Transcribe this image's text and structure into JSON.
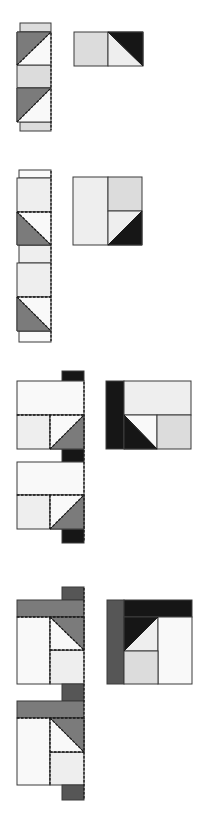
{
  "colors": {
    "light": "#dcdcdc",
    "lighter": "#eeeeee",
    "white": "#f9f9f9",
    "mid": "#7b7b7b",
    "dark": "#565656",
    "black": "#161616",
    "outline": "#3a3a3a"
  },
  "steps": [
    {
      "id": "step-1",
      "strip": {
        "rects": [
          {
            "x": 20,
            "y": 23,
            "w": 31,
            "h": 9,
            "fill": "light"
          },
          {
            "x": 17,
            "y": 65,
            "w": 34,
            "h": 23,
            "fill": "light"
          },
          {
            "x": 20,
            "y": 122,
            "w": 31,
            "h": 9,
            "fill": "light"
          }
        ],
        "triangles": [
          {
            "pts": "17,32 51,32 51,65 17,65",
            "fill": "white"
          },
          {
            "pts": "17,32 51,32 17,65",
            "fill": "mid"
          },
          {
            "pts": "17,88 51,88 51,122 17,122",
            "fill": "white"
          },
          {
            "pts": "17,88 51,88 17,122",
            "fill": "mid"
          }
        ],
        "seams": [
          "M17,65 L51,32",
          "M17,122 L51,88",
          "M51,33 L51,130"
        ]
      },
      "result": {
        "rects": [
          {
            "x": 74,
            "y": 32,
            "w": 34,
            "h": 34,
            "fill": "light"
          },
          {
            "x": 108,
            "y": 32,
            "w": 35,
            "h": 34,
            "fill": "lighter"
          }
        ],
        "triangles": [
          {
            "pts": "108,32 143,32 143,66",
            "fill": "black"
          }
        ],
        "lines": [
          "M108,32 L143,66"
        ]
      }
    },
    {
      "id": "step-2",
      "strip": {
        "rects": [
          {
            "x": 19,
            "y": 170,
            "w": 32,
            "h": 8,
            "fill": "white"
          },
          {
            "x": 17,
            "y": 178,
            "w": 34,
            "h": 34,
            "fill": "lighter"
          },
          {
            "x": 19,
            "y": 245,
            "w": 32,
            "h": 18,
            "fill": "lighter"
          },
          {
            "x": 17,
            "y": 263,
            "w": 34,
            "h": 34,
            "fill": "lighter"
          },
          {
            "x": 19,
            "y": 331,
            "w": 32,
            "h": 11,
            "fill": "white"
          }
        ],
        "triangles": [
          {
            "pts": "17,212 51,212 51,245 17,245",
            "fill": "white"
          },
          {
            "pts": "17,212 51,245 17,245",
            "fill": "mid"
          },
          {
            "pts": "17,297 51,297 51,331 17,331",
            "fill": "white"
          },
          {
            "pts": "17,297 51,331 17,331",
            "fill": "mid"
          }
        ],
        "seams": [
          "M17,212 L51,212",
          "M17,212 L51,245",
          "M17,297 L51,297",
          "M17,297 L51,331",
          "M51,171 L51,341"
        ]
      },
      "result": {
        "rects": [
          {
            "x": 73,
            "y": 177,
            "w": 35,
            "h": 68,
            "fill": "lighter"
          },
          {
            "x": 108,
            "y": 177,
            "w": 34,
            "h": 34,
            "fill": "light"
          },
          {
            "x": 108,
            "y": 211,
            "w": 34,
            "h": 34,
            "fill": "lighter"
          }
        ],
        "triangles": [
          {
            "pts": "142,211 142,245 108,245",
            "fill": "black"
          }
        ],
        "lines": [
          "M142,211 L108,245"
        ]
      }
    },
    {
      "id": "step-3",
      "strip": {
        "rects": [
          {
            "x": 62,
            "y": 371,
            "w": 22,
            "h": 10,
            "fill": "black"
          },
          {
            "x": 17,
            "y": 381,
            "w": 67,
            "h": 34,
            "fill": "white"
          },
          {
            "x": 17,
            "y": 415,
            "w": 33,
            "h": 34,
            "fill": "lighter"
          },
          {
            "x": 62,
            "y": 449,
            "w": 22,
            "h": 13,
            "fill": "black"
          },
          {
            "x": 17,
            "y": 462,
            "w": 67,
            "h": 33,
            "fill": "white"
          },
          {
            "x": 17,
            "y": 495,
            "w": 33,
            "h": 34,
            "fill": "lighter"
          },
          {
            "x": 62,
            "y": 529,
            "w": 22,
            "h": 14,
            "fill": "black"
          }
        ],
        "triangles": [
          {
            "pts": "50,415 84,415 84,449 50,449",
            "fill": "white"
          },
          {
            "pts": "84,415 84,449 50,449",
            "fill": "mid"
          },
          {
            "pts": "50,495 84,495 84,529 50,529",
            "fill": "white"
          },
          {
            "pts": "84,495 84,529 50,529",
            "fill": "mid"
          }
        ],
        "seams": [
          "M17,415 L84,415",
          "M50,415 L50,449",
          "M50,449 L84,415",
          "M17,495 L84,495",
          "M50,495 L50,529",
          "M50,529 L84,495",
          "M84,382 L84,542"
        ]
      },
      "result": {
        "rects": [
          {
            "x": 106,
            "y": 381,
            "w": 18,
            "h": 68,
            "fill": "black"
          },
          {
            "x": 124,
            "y": 381,
            "w": 67,
            "h": 34,
            "fill": "lighter"
          },
          {
            "x": 124,
            "y": 415,
            "w": 33,
            "h": 34,
            "fill": "white"
          },
          {
            "x": 157,
            "y": 415,
            "w": 34,
            "h": 34,
            "fill": "light"
          }
        ],
        "triangles": [
          {
            "pts": "124,415 157,449 124,449",
            "fill": "black"
          }
        ],
        "lines": [
          "M124,415 L157,449"
        ]
      }
    },
    {
      "id": "step-4",
      "strip": {
        "rects": [
          {
            "x": 62,
            "y": 587,
            "w": 22,
            "h": 13,
            "fill": "dark"
          },
          {
            "x": 17,
            "y": 600,
            "w": 67,
            "h": 17,
            "fill": "mid"
          },
          {
            "x": 17,
            "y": 617,
            "w": 33,
            "h": 67,
            "fill": "white"
          },
          {
            "x": 50,
            "y": 650,
            "w": 34,
            "h": 34,
            "fill": "lighter"
          },
          {
            "x": 62,
            "y": 684,
            "w": 22,
            "h": 17,
            "fill": "dark"
          },
          {
            "x": 17,
            "y": 701,
            "w": 67,
            "h": 17,
            "fill": "mid"
          },
          {
            "x": 17,
            "y": 718,
            "w": 33,
            "h": 67,
            "fill": "white"
          },
          {
            "x": 50,
            "y": 752,
            "w": 34,
            "h": 33,
            "fill": "lighter"
          },
          {
            "x": 62,
            "y": 785,
            "w": 22,
            "h": 15,
            "fill": "dark"
          }
        ],
        "triangles": [
          {
            "pts": "50,617 84,617 84,650 50,650",
            "fill": "white"
          },
          {
            "pts": "50,617 84,617 84,650",
            "fill": "mid"
          },
          {
            "pts": "50,718 84,718 84,752 50,752",
            "fill": "white"
          },
          {
            "pts": "50,718 84,718 84,752",
            "fill": "mid"
          }
        ],
        "seams": [
          "M17,617 L84,617",
          "M50,617 L50,684",
          "M50,650 L84,650",
          "M50,617 L84,650",
          "M17,718 L84,718",
          "M50,718 L50,785",
          "M50,752 L84,752",
          "M50,718 L84,752",
          "M84,588 L84,799"
        ]
      },
      "result": {
        "rects": [
          {
            "x": 107,
            "y": 600,
            "w": 17,
            "h": 84,
            "fill": "dark"
          },
          {
            "x": 124,
            "y": 600,
            "w": 68,
            "h": 17,
            "fill": "black"
          },
          {
            "x": 124,
            "y": 617,
            "w": 34,
            "h": 34,
            "fill": "lighter"
          },
          {
            "x": 158,
            "y": 617,
            "w": 34,
            "h": 67,
            "fill": "white"
          },
          {
            "x": 124,
            "y": 651,
            "w": 34,
            "h": 33,
            "fill": "light"
          }
        ],
        "triangles": [
          {
            "pts": "124,617 158,617 124,651",
            "fill": "black"
          }
        ],
        "lines": [
          "M124,651 L158,617"
        ]
      }
    }
  ]
}
